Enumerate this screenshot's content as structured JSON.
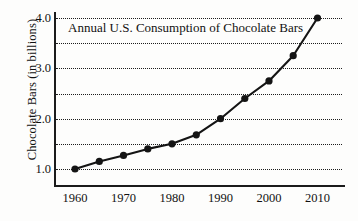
{
  "chart_data": {
    "type": "line",
    "title": "Annual U.S. Consumption of Chocolate Bars",
    "xlabel": "",
    "ylabel": "Chocolate Bars (in billions)",
    "x": [
      1960,
      1965,
      1970,
      1975,
      1980,
      1985,
      1990,
      1995,
      2000,
      2005,
      2010
    ],
    "values": [
      1.0,
      1.15,
      1.27,
      1.4,
      1.5,
      1.68,
      2.0,
      2.4,
      2.75,
      3.25,
      4.0
    ],
    "series": [
      {
        "name": "Chocolate bar consumption",
        "values": [
          1.0,
          1.15,
          1.27,
          1.4,
          1.5,
          1.68,
          2.0,
          2.4,
          2.75,
          3.25,
          4.0
        ]
      }
    ],
    "xlim": [
      1957,
      2013
    ],
    "ylim": [
      0.55,
      4.12
    ],
    "xticks": [
      1960,
      1970,
      1980,
      1990,
      2000,
      2010
    ],
    "xtick_labels": [
      "1960",
      "1970",
      "1980",
      "1990",
      "2000",
      "2010"
    ],
    "yticks": [
      1.0,
      2.0,
      3.0,
      4.0
    ],
    "ytick_labels": [
      "1.0",
      "2.0",
      "3.0",
      "4.0"
    ],
    "gridlines": [
      1.0,
      1.5,
      2.0,
      2.5,
      3.0,
      3.5,
      4.0
    ],
    "grid": "horizontal-dotted",
    "legend": "none",
    "line_color": "#141414",
    "marker": "filled-circle",
    "marker_color": "#141414",
    "background_color": "#fdfdfc",
    "axis_color": "#1b1b1b"
  }
}
